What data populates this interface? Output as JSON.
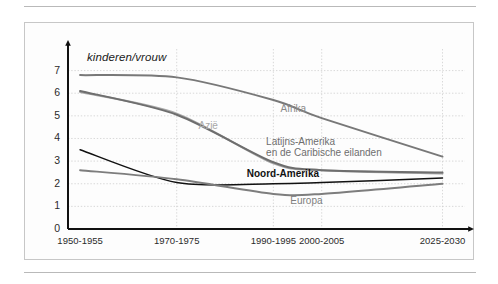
{
  "figure": {
    "axis_title": "kinderen/vrouw"
  },
  "chart_data": {
    "type": "line",
    "title": "",
    "xlabel": "",
    "ylabel": "kinderen/vrouw",
    "ylim": [
      0,
      7.6
    ],
    "yticks": [
      "0",
      "1",
      "2",
      "3",
      "4",
      "5",
      "6",
      "7"
    ],
    "grid": true,
    "legend_position": "inline-labels",
    "categories": [
      "1950-1955",
      "1970-1975",
      "1990-1995",
      "2000-2005",
      "2025-2030"
    ],
    "x": [
      1952.5,
      1972.5,
      1992.5,
      2002.5,
      2027.5
    ],
    "series": [
      {
        "name": "Afrika",
        "color": "#787878",
        "values": [
          6.8,
          6.7,
          5.7,
          4.9,
          3.2
        ],
        "label_x": 1994,
        "label_y": 5.3
      },
      {
        "name": "Azië",
        "color": "#a8a8a8",
        "values": [
          6.05,
          5.1,
          2.9,
          2.6,
          2.45
        ],
        "label_x": 1977,
        "label_y": 4.55
      },
      {
        "name": "Latijns-Amerika en de Caribische eilanden",
        "color": "#6e6e6e",
        "values": [
          6.1,
          5.05,
          2.95,
          2.6,
          2.5
        ],
        "label_x": 1991,
        "label_y": 3.85
      },
      {
        "name": "Noord-Amerika",
        "color": "#111111",
        "values": [
          3.5,
          2.05,
          2.0,
          2.05,
          2.25
        ],
        "label_x": 1987,
        "label_y": 2.45
      },
      {
        "name": "Europa",
        "color": "#7d7d7d",
        "values": [
          2.6,
          2.2,
          1.55,
          1.55,
          2.0
        ],
        "label_x": 1996,
        "label_y": 1.25
      }
    ]
  }
}
